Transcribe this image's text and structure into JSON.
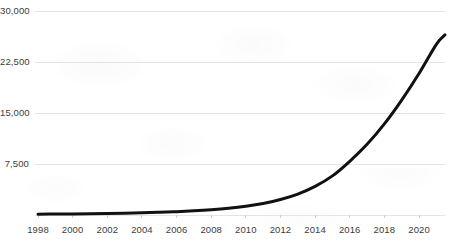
{
  "chart_data": {
    "type": "line",
    "title": "",
    "subtitle": "",
    "xlabel": "",
    "ylabel": "",
    "xlim": [
      1998,
      2021.5
    ],
    "ylim": [
      0,
      30000
    ],
    "grid": true,
    "legend": false,
    "legend_position": "none",
    "y_ticks": [
      {
        "value": 30000,
        "label": "30,000"
      },
      {
        "value": 22500,
        "label": "22,500"
      },
      {
        "value": 15000,
        "label": "15,000"
      },
      {
        "value": 7500,
        "label": "7,500"
      }
    ],
    "x_ticks": [
      {
        "value": 1998,
        "label": "1998"
      },
      {
        "value": 2000,
        "label": "2000"
      },
      {
        "value": 2002,
        "label": "2002"
      },
      {
        "value": 2004,
        "label": "2004"
      },
      {
        "value": 2006,
        "label": "2006"
      },
      {
        "value": 2008,
        "label": "2008"
      },
      {
        "value": 2010,
        "label": "2010"
      },
      {
        "value": 2012,
        "label": "2012"
      },
      {
        "value": 2014,
        "label": "2014"
      },
      {
        "value": 2016,
        "label": "2016"
      },
      {
        "value": 2018,
        "label": "2018"
      },
      {
        "value": 2020,
        "label": "2020"
      }
    ],
    "series": [
      {
        "name": "series-1",
        "color": "#111111",
        "line_width": 3,
        "x": [
          1998,
          1999,
          2000,
          2001,
          2002,
          2003,
          2004,
          2005,
          2006,
          2007,
          2008,
          2009,
          2010,
          2011,
          2012,
          2013,
          2014,
          2015,
          2016,
          2017,
          2018,
          2019,
          2020,
          2021,
          2021.5
        ],
        "values": [
          120,
          140,
          165,
          195,
          230,
          275,
          330,
          400,
          490,
          610,
          770,
          990,
          1290,
          1700,
          2270,
          3070,
          4200,
          5750,
          7900,
          10400,
          13400,
          16900,
          20800,
          25100,
          26500
        ]
      }
    ],
    "colors": {
      "line": "#111111",
      "grid": "#e4e4e4",
      "axis": "#111111",
      "tick_text": "#3c3c3c",
      "background": "#ffffff"
    }
  }
}
